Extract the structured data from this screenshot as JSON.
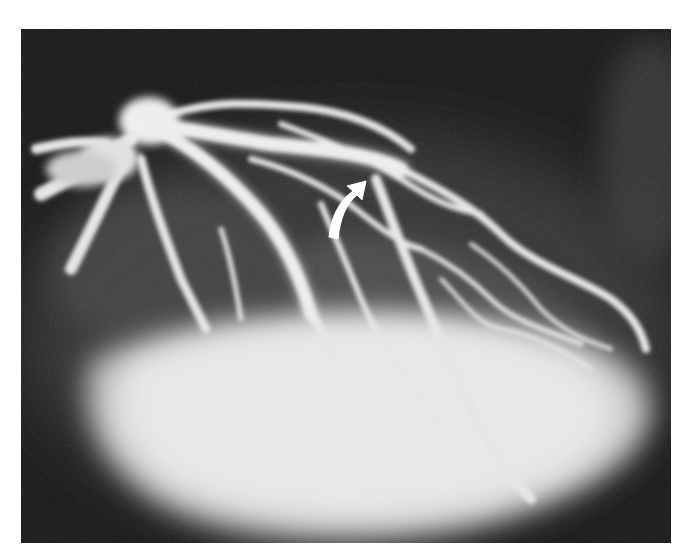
{
  "image": {
    "description": "Coronary angiogram showing contrast-filled branching coronary arteries over a bright ventricular blush, with a white curved arrow pointing to a vessel segment",
    "annotation": {
      "type": "curved-arrow",
      "color": "#ffffff",
      "position": {
        "x": 340,
        "y": 205
      }
    },
    "colors": {
      "background": "#ffffff",
      "frame": "#1a1a1a",
      "vessel": "#e8e8e8",
      "blush": "#e6e6e6"
    }
  }
}
